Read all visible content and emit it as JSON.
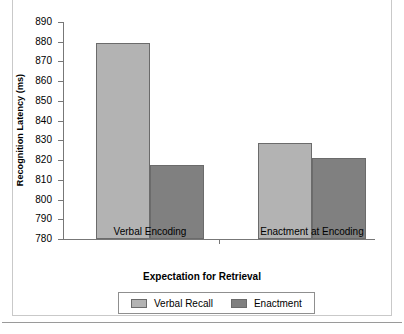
{
  "chart_data": {
    "type": "bar",
    "title": "",
    "xlabel": "Expectation for Retrieval",
    "ylabel": "Recognition Latency (ms)",
    "categories": [
      "Verbal Encoding",
      "Enactment at Encoding"
    ],
    "series": [
      {
        "name": "Verbal Recall",
        "values": [
          879.5,
          828.5
        ],
        "color": "#b3b3b3"
      },
      {
        "name": "Enactment",
        "values": [
          817.5,
          821.0
        ],
        "color": "#808080"
      }
    ],
    "ylim": [
      780,
      890
    ],
    "ytick_step": 10,
    "yticks": [
      890,
      880,
      870,
      860,
      850,
      840,
      830,
      820,
      810,
      800,
      790,
      780
    ],
    "ytick_labels": [
      "890",
      "880",
      "870",
      "860",
      "850",
      "840",
      "830",
      "820",
      "810",
      "800",
      "790",
      "780"
    ],
    "grid": false,
    "legend_position": "bottom-center",
    "axis_color": "#777777",
    "bar_edge_color": "#6b6b6b"
  },
  "legend": {
    "items": [
      {
        "label": "Verbal Recall",
        "color": "#b3b3b3"
      },
      {
        "label": "Enactment",
        "color": "#808080"
      }
    ]
  }
}
